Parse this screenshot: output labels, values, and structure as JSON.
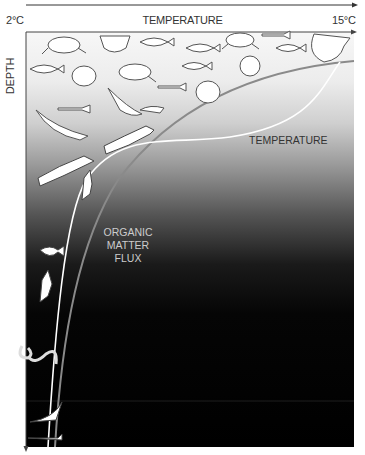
{
  "axes": {
    "x": {
      "title": "TEMPERATURE",
      "min_label": "2°C",
      "max_label": "15°C"
    },
    "y": {
      "title": "DEPTH"
    }
  },
  "curves": {
    "temperature": {
      "label": "TEMPERATURE",
      "color": "#ffffff"
    },
    "organic_matter_flux": {
      "label_lines": [
        "ORGANIC",
        "MATTER",
        "FLUX"
      ],
      "color": "#888888"
    }
  },
  "colors": {
    "surface": "#f7f7f7",
    "deep": "#000000",
    "axis": "#333333"
  },
  "organisms": [
    "sea-turtle",
    "sunfish",
    "tuna",
    "grouper",
    "whale-shark",
    "sperm-whale",
    "squid",
    "anglerfish",
    "eel",
    "deep-fish"
  ]
}
